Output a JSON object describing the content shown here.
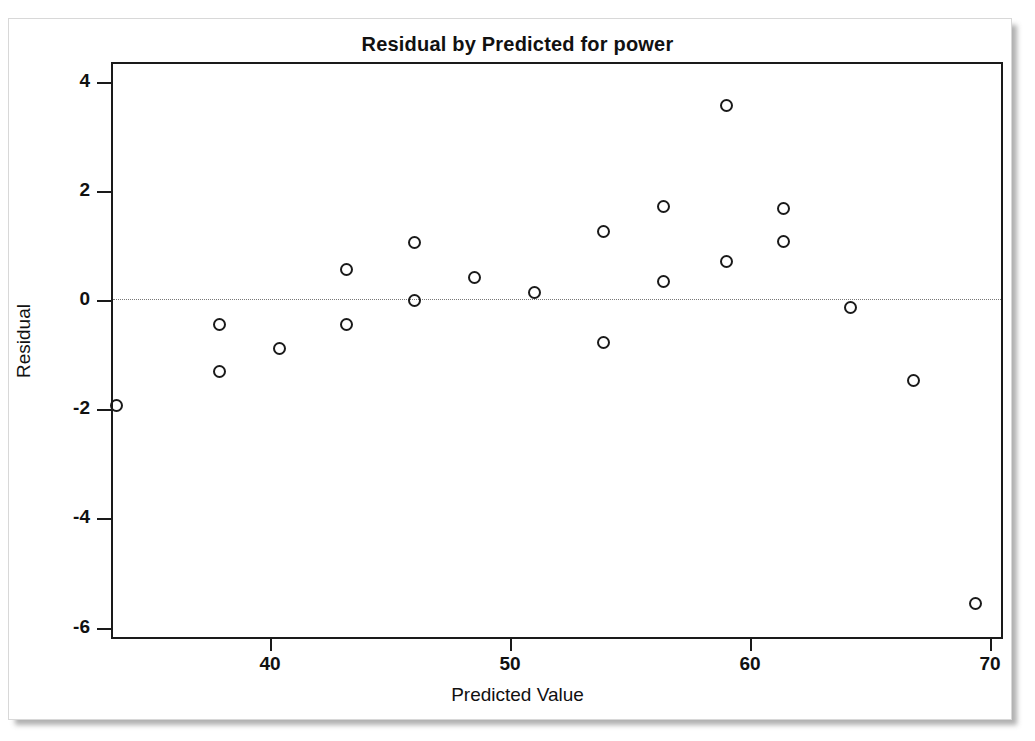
{
  "chart_data": {
    "type": "scatter",
    "title": "Residual by Predicted for power",
    "xlabel": "Predicted Value",
    "ylabel": "Residual",
    "xlim": [
      33.0,
      70.5
    ],
    "ylim": [
      -6.6,
      4.35
    ],
    "xticks": [
      40,
      50,
      60,
      70
    ],
    "yticks": [
      4,
      2,
      0,
      -2,
      -4,
      -6
    ],
    "xtick_labels": [
      "40",
      "50",
      "60",
      "70"
    ],
    "ytick_labels": [
      "4",
      "2",
      "0",
      "-2",
      "-4",
      "-6"
    ],
    "grid": false,
    "legend": "none",
    "reference_line": {
      "y": 0,
      "style": "dotted",
      "color": "#777777"
    },
    "marker": {
      "shape": "open-circle",
      "color": "#1a1a1a",
      "size": 13
    },
    "points": [
      {
        "x": 33.6,
        "y": -1.93
      },
      {
        "x": 37.9,
        "y": -0.45
      },
      {
        "x": 37.9,
        "y": -1.31
      },
      {
        "x": 40.4,
        "y": -0.88
      },
      {
        "x": 43.2,
        "y": 0.55
      },
      {
        "x": 43.2,
        "y": -0.45
      },
      {
        "x": 46.0,
        "y": 1.05
      },
      {
        "x": 46.0,
        "y": 0.0
      },
      {
        "x": 48.5,
        "y": 0.42
      },
      {
        "x": 51.0,
        "y": 0.13
      },
      {
        "x": 53.9,
        "y": 1.26
      },
      {
        "x": 53.9,
        "y": -0.78
      },
      {
        "x": 56.4,
        "y": 1.72
      },
      {
        "x": 56.4,
        "y": 0.34
      },
      {
        "x": 59.0,
        "y": 3.57
      },
      {
        "x": 59.0,
        "y": 0.7
      },
      {
        "x": 61.4,
        "y": 1.67
      },
      {
        "x": 61.4,
        "y": 1.07
      },
      {
        "x": 64.2,
        "y": -0.14
      },
      {
        "x": 66.8,
        "y": -1.47
      },
      {
        "x": 69.4,
        "y": -5.55
      }
    ]
  }
}
